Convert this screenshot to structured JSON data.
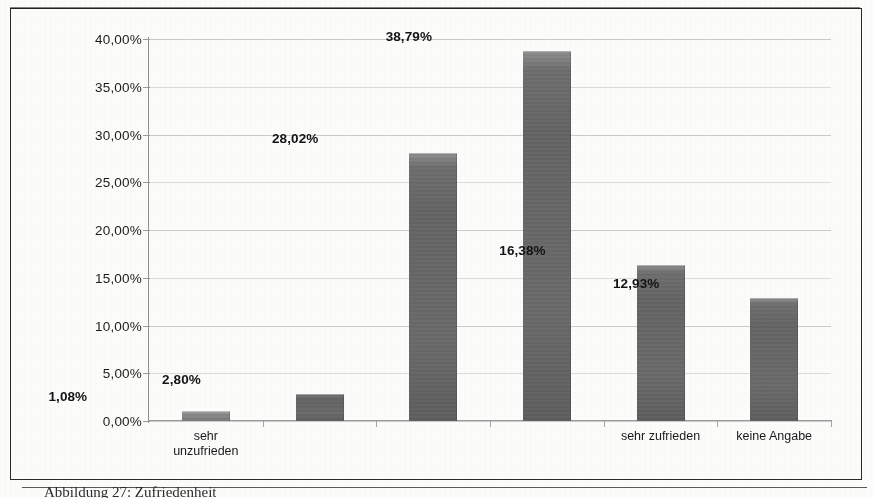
{
  "figure": {
    "caption": "Abbildung 27: Zufriedenheit",
    "frame_color": "#2a2a2a"
  },
  "chart_data": {
    "type": "bar",
    "title": "",
    "xlabel": "",
    "ylabel": "",
    "categories": [
      "sehr unzufrieden",
      "",
      "",
      "",
      "sehr zufrieden",
      "keine Angabe"
    ],
    "category_lines": [
      [
        "sehr",
        "unzufrieden"
      ],
      [
        ""
      ],
      [
        ""
      ],
      [
        ""
      ],
      [
        "sehr zufrieden"
      ],
      [
        "keine Angabe"
      ]
    ],
    "values": [
      1.08,
      2.8,
      28.02,
      38.79,
      16.38,
      12.93
    ],
    "data_labels": [
      "1,08%",
      "2,80%",
      "28,02%",
      "38,79%",
      "16,38%",
      "12,93%"
    ],
    "ylim": [
      0,
      40
    ],
    "ytick_values": [
      0,
      5,
      10,
      15,
      20,
      25,
      30,
      35,
      40
    ],
    "ytick_labels": [
      "0,00%",
      "5,00%",
      "10,00%",
      "15,00%",
      "20,00%",
      "25,00%",
      "30,00%",
      "35,00%",
      "40,00%"
    ],
    "grid": true,
    "grid_axis": "y",
    "legend": false,
    "bar_color": "#6a6a6a",
    "decimal_separator": ",",
    "series": [
      {
        "name": "Anteil",
        "values": [
          1.08,
          2.8,
          28.02,
          38.79,
          16.38,
          12.93
        ]
      }
    ]
  }
}
